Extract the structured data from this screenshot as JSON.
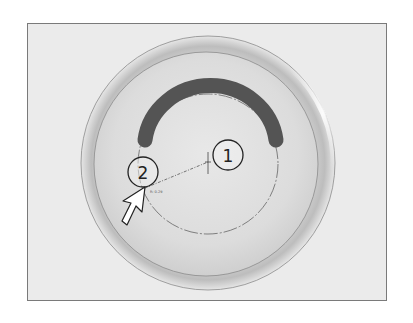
{
  "figure": {
    "callouts": [
      {
        "id": "1",
        "label": "1"
      },
      {
        "id": "2",
        "label": "2"
      }
    ],
    "cursor_readout": "R: 0.29",
    "colors": {
      "frame_bg": "#ebebeb",
      "frame_border": "#7a7a7a",
      "disc_face": "#dedede",
      "disc_rim": "#c9c9c9",
      "arc": "#545454",
      "guide": "#555555"
    }
  }
}
